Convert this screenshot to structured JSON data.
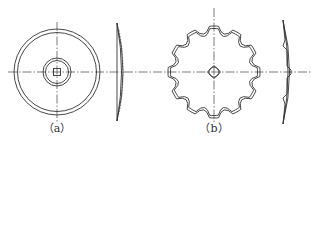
{
  "figure": {
    "stroke_color": "#333333",
    "background": "#ffffff",
    "panels": [
      {
        "id": "a",
        "label": "（a）",
        "type": "plain-disc",
        "views": [
          "front-view",
          "side-view"
        ]
      },
      {
        "id": "b",
        "label": "（b）",
        "type": "notched-disc",
        "notch_count": 12,
        "views": [
          "front-view",
          "side-view"
        ]
      }
    ]
  }
}
